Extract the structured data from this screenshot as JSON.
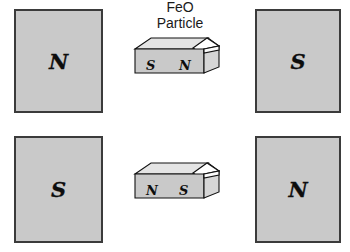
{
  "diagram": {
    "background_color": "#ffffff",
    "block_fill_color": "#c9c9c9",
    "block_border_color": "#3b3b3b",
    "pole_text_color": "#0d0d0d"
  },
  "label": {
    "line1": "FeO",
    "line2": "Particle"
  },
  "magnet_blocks": [
    {
      "id": "top-left",
      "pole": "N"
    },
    {
      "id": "top-right",
      "pole": "S"
    },
    {
      "id": "bottom-left",
      "pole": "S"
    },
    {
      "id": "bottom-right",
      "pole": "N"
    }
  ],
  "particles": [
    {
      "id": "top",
      "left_pole": "S",
      "right_pole": "N"
    },
    {
      "id": "bottom",
      "left_pole": "N",
      "right_pole": "S"
    }
  ]
}
